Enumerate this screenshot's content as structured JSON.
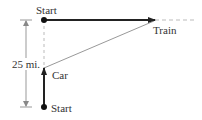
{
  "diagram": {
    "type": "motion-problem-right-triangle",
    "labels": {
      "train_start": "Start",
      "train": "Train",
      "car": "Car",
      "car_start": "Start",
      "distance": "25 mi."
    },
    "colors": {
      "heavy_line": "#222222",
      "thin_line": "#888888",
      "dashed_line": "#bbbbbb",
      "text": "#333333",
      "background": "#ffffff"
    },
    "geometry": {
      "train_start_point": [
        44,
        20
      ],
      "train_arrow_tip": [
        155,
        20
      ],
      "car_start_point": [
        44,
        107
      ],
      "car_arrow_tip": [
        44,
        68
      ],
      "dimension_line_x": 26,
      "dimension_top_y": 20,
      "dimension_bottom_y": 107
    }
  }
}
